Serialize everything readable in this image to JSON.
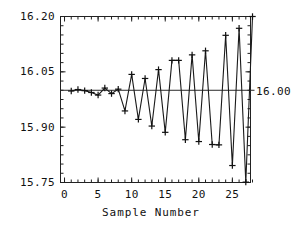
{
  "chart_data": {
    "type": "line",
    "title": "",
    "subtitle": "",
    "xlabel": "Sample Number",
    "ylabel": "",
    "xlim": [
      -0.6,
      27.7
    ],
    "ylim": [
      15.75,
      16.2
    ],
    "grid": false,
    "legend": null,
    "marker": "plus",
    "x": [
      1,
      2,
      3,
      4,
      5,
      6,
      7,
      8,
      9,
      10,
      11,
      12,
      13,
      14,
      15,
      16,
      17,
      18,
      19,
      20,
      21,
      22,
      23,
      24,
      25,
      26,
      27,
      28
    ],
    "values": [
      15.998,
      16.002,
      15.999,
      15.994,
      15.987,
      16.006,
      15.991,
      16.003,
      15.944,
      16.043,
      15.921,
      16.032,
      15.903,
      16.056,
      15.886,
      16.081,
      16.081,
      15.866,
      16.096,
      15.861,
      16.107,
      15.853,
      15.852,
      16.149,
      15.796,
      16.168,
      15.751,
      16.2
    ],
    "annotations": [
      {
        "text": "16.00",
        "value": 16.0,
        "position": "right-of-axis",
        "kind": "target-line-label"
      }
    ],
    "reference_lines": [
      {
        "orientation": "horizontal",
        "value": 16.0,
        "label": "16.00"
      }
    ],
    "yticks": [
      15.75,
      15.9,
      16.05,
      16.2
    ],
    "ytick_labels": [
      "15.75",
      "15.90",
      "16.05",
      "16.20"
    ],
    "xticks": [
      0,
      5,
      10,
      15,
      20,
      25
    ],
    "xtick_labels": [
      "0",
      "5",
      "10",
      "15",
      "20",
      "25"
    ],
    "y_minor_tick_step": 0.025,
    "x_minor_tick_step": 1
  },
  "axes": {
    "x_title": "Sample Number",
    "y_ticks": [
      {
        "label": "16.20",
        "value": 16.2
      },
      {
        "label": "16.05",
        "value": 16.05
      },
      {
        "label": "15.90",
        "value": 15.9
      },
      {
        "label": "15.75",
        "value": 15.75
      }
    ],
    "x_ticks": [
      {
        "label": "0",
        "value": 0
      },
      {
        "label": "5",
        "value": 5
      },
      {
        "label": "10",
        "value": 10
      },
      {
        "label": "15",
        "value": 15
      },
      {
        "label": "20",
        "value": 20
      },
      {
        "label": "25",
        "value": 25
      }
    ]
  },
  "target": {
    "label": "16.00",
    "value": 16.0
  },
  "colors": {
    "background": "#ffffff",
    "foreground": "#111111",
    "series": "#1a1a1a",
    "reference_line": "#2a2a2a",
    "axis": "#222222"
  }
}
